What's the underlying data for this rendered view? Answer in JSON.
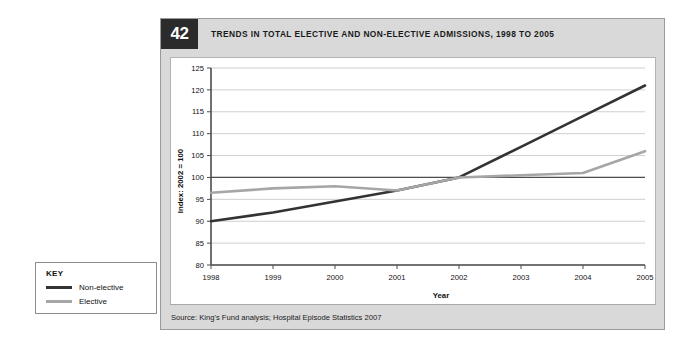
{
  "figure": {
    "number": "42",
    "title": "TRENDS IN TOTAL ELECTIVE AND NON-ELECTIVE ADMISSIONS, 1998 TO 2005",
    "source": "Source: King's Fund analysis; Hospital Episode Statistics 2007"
  },
  "key": {
    "heading": "KEY",
    "entries": [
      {
        "label": "Non-elective",
        "color": "#333333"
      },
      {
        "label": "Elective",
        "color": "#a6a6a6"
      }
    ]
  },
  "chart_data": {
    "type": "line",
    "title": "TRENDS IN TOTAL ELECTIVE AND NON-ELECTIVE ADMISSIONS, 1998 TO 2005",
    "xlabel": "Year",
    "ylabel": "Index: 2002 = 100",
    "categories": [
      "1998",
      "1999",
      "2000",
      "2001",
      "2002",
      "2003",
      "2004",
      "2005"
    ],
    "x": [
      1998,
      1999,
      2000,
      2001,
      2002,
      2003,
      2004,
      2005
    ],
    "xlim": [
      1998,
      2005
    ],
    "ylim": [
      80,
      125
    ],
    "yticks": [
      80,
      85,
      90,
      95,
      100,
      105,
      110,
      115,
      120,
      125
    ],
    "ytick_labels": [
      "80",
      "85",
      "90",
      "95",
      "100",
      "105",
      "110",
      "115",
      "120",
      "125"
    ],
    "xtick_labels": [
      "1998",
      "1999",
      "2000",
      "2001",
      "2002",
      "2003",
      "2004",
      "2005"
    ],
    "grid": "horizontal",
    "legend_position": "outside-bottom-left",
    "reference_line": 100,
    "series": [
      {
        "name": "Non-elective",
        "color": "#333333",
        "values": [
          90,
          92,
          94.5,
          97,
          100,
          107,
          114,
          121
        ]
      },
      {
        "name": "Elective",
        "color": "#a6a6a6",
        "values": [
          96.5,
          97.5,
          98,
          97,
          100,
          100.5,
          101,
          106
        ]
      }
    ]
  }
}
